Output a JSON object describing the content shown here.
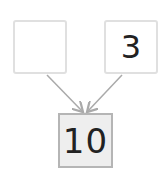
{
  "diagram": {
    "type": "number-bond",
    "parts": [
      {
        "id": "left",
        "value": ""
      },
      {
        "id": "right",
        "value": "3"
      }
    ],
    "whole": {
      "value": "10"
    },
    "colors": {
      "part_border": "#e0e0e0",
      "whole_border": "#b5b5b5",
      "whole_fill": "#eeeeee",
      "arrow": "#aaaaaa"
    }
  }
}
